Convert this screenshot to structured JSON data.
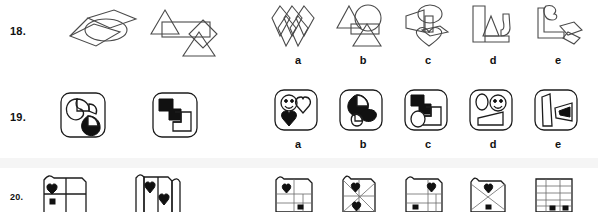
{
  "page": {
    "kind": "abstract-reasoning-test-page",
    "ink_color": "#1c1c1c",
    "line_color": "#4a4a4a",
    "background": "#ffffff"
  },
  "rows": [
    {
      "number": "18.",
      "problem_figures": [
        {
          "name": "overlapping-diamonds-and-ellipse",
          "shapes": [
            "diamond",
            "ellipse",
            "diamond"
          ]
        },
        {
          "name": "triangle-rectangle-diamond-triangle",
          "shapes": [
            "triangle",
            "rectangle",
            "diamond",
            "triangle"
          ]
        }
      ],
      "options": [
        {
          "letter": "a",
          "name": "three-overlapping-diamonds"
        },
        {
          "letter": "b",
          "name": "triangle-circle-triangle-rectangle"
        },
        {
          "letter": "c",
          "name": "ellipse-heart-wedge"
        },
        {
          "letter": "d",
          "name": "blocky-angular-outline"
        },
        {
          "letter": "e",
          "name": "notched-bracket-with-diamonds"
        }
      ]
    },
    {
      "number": "19.",
      "problem_figures": [
        {
          "name": "rounded-square-with-pac-shapes",
          "shapes": [
            "rounded-square",
            "pac-circle-outline",
            "pac-circle-filled"
          ]
        },
        {
          "name": "rounded-square-with-blocky-steps",
          "shapes": [
            "rounded-square",
            "filled-step-block",
            "outline-step-block"
          ]
        }
      ],
      "options": [
        {
          "letter": "a",
          "name": "smiley-hearts-tile"
        },
        {
          "letter": "b",
          "name": "filled-pac-shapes-tile"
        },
        {
          "letter": "c",
          "name": "filled-step-block-tile"
        },
        {
          "letter": "d",
          "name": "oval-smiley-wedge-tile"
        },
        {
          "letter": "e",
          "name": "bars-and-arrow-tile"
        }
      ]
    },
    {
      "number": "20.",
      "problem_figures": [
        {
          "name": "folded-paper-two-hearts",
          "shapes": [
            "folded-square",
            "heart",
            "small-square"
          ]
        },
        {
          "name": "folded-paper-vertical-panels",
          "shapes": [
            "folded-square",
            "heart",
            "heart"
          ]
        }
      ],
      "options": [
        {
          "letter": "a",
          "name": "grid-panel-heart-topleft"
        },
        {
          "letter": "b",
          "name": "radial-fold-panel"
        },
        {
          "letter": "c",
          "name": "grid-panel-heart-topright"
        },
        {
          "letter": "d",
          "name": "cross-fold-panel"
        },
        {
          "letter": "e",
          "name": "horizontal-lines-panel"
        }
      ]
    }
  ]
}
